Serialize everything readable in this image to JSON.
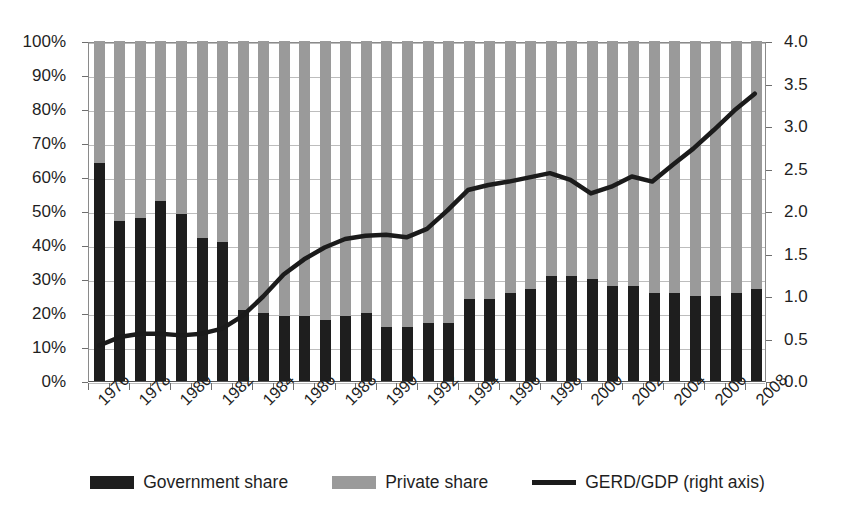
{
  "chart_data": {
    "type": "bar",
    "title": "",
    "subtitle": "",
    "xlabel": "",
    "ylabel": "",
    "grid": true,
    "legend_position": "bottom",
    "categories": [
      "1976",
      "1977",
      "1978",
      "1979",
      "1980",
      "1981",
      "1982",
      "1983",
      "1984",
      "1985",
      "1986",
      "1987",
      "1988",
      "1989",
      "1990",
      "1991",
      "1992",
      "1993",
      "1994",
      "1995",
      "1996",
      "1997",
      "1998",
      "1999",
      "2000",
      "2001",
      "2002",
      "2003",
      "2004",
      "2005",
      "2006",
      "2007",
      "2008"
    ],
    "x_tick_labels": [
      "1976",
      "1978",
      "1980",
      "1982",
      "1984",
      "1986",
      "1988",
      "1990",
      "1992",
      "1994",
      "1996",
      "1998",
      "2000",
      "2002",
      "2004",
      "2006",
      "2008"
    ],
    "left_axis": {
      "label": "",
      "ticks": [
        "0%",
        "10%",
        "20%",
        "30%",
        "40%",
        "50%",
        "60%",
        "70%",
        "80%",
        "90%",
        "100%"
      ],
      "min": 0,
      "max": 100,
      "step": 10,
      "unit": "%"
    },
    "right_axis": {
      "label": "GERD/GDP (right axis)",
      "ticks": [
        "0.0",
        "0.5",
        "1.0",
        "1.5",
        "2.0",
        "2.5",
        "3.0",
        "3.5",
        "4.0"
      ],
      "min": 0,
      "max": 4.0,
      "step": 0.5
    },
    "stacked": true,
    "series": [
      {
        "name": "Government share",
        "type": "bar-stack",
        "color": "#1e1e1e",
        "axis": "left",
        "unit": "%",
        "values": [
          64,
          47,
          48,
          53,
          49,
          42,
          41,
          21,
          20,
          19,
          19,
          18,
          19,
          20,
          16,
          16,
          17,
          17,
          24,
          24,
          26,
          27,
          31,
          31,
          30,
          28,
          28,
          26,
          26,
          25,
          25,
          26,
          27
        ]
      },
      {
        "name": "Private share",
        "type": "bar-stack",
        "color": "#9a9a9a",
        "axis": "left",
        "unit": "%",
        "values": [
          36,
          53,
          52,
          47,
          51,
          58,
          59,
          79,
          80,
          81,
          81,
          82,
          81,
          80,
          84,
          84,
          83,
          83,
          76,
          76,
          74,
          73,
          69,
          69,
          70,
          72,
          72,
          74,
          74,
          75,
          75,
          74,
          73
        ]
      },
      {
        "name": "GERD/GDP (right axis)",
        "type": "line",
        "color": "#1b1b1b",
        "axis": "right",
        "unit": "",
        "values": [
          0.42,
          0.52,
          0.56,
          0.56,
          0.54,
          0.56,
          0.62,
          0.77,
          1.0,
          1.26,
          1.44,
          1.58,
          1.68,
          1.72,
          1.73,
          1.7,
          1.8,
          2.02,
          2.26,
          2.32,
          2.36,
          2.41,
          2.46,
          2.38,
          2.22,
          2.3,
          2.42,
          2.36,
          2.56,
          2.75,
          2.97,
          3.2,
          3.4
        ]
      }
    ]
  },
  "legend": {
    "items": [
      {
        "label": "Government share",
        "swatch": "dark-square",
        "color": "#1e1e1e"
      },
      {
        "label": "Private share",
        "swatch": "gray-square",
        "color": "#9a9a9a"
      },
      {
        "label": "GERD/GDP (right axis)",
        "swatch": "line",
        "color": "#1b1b1b"
      }
    ]
  }
}
